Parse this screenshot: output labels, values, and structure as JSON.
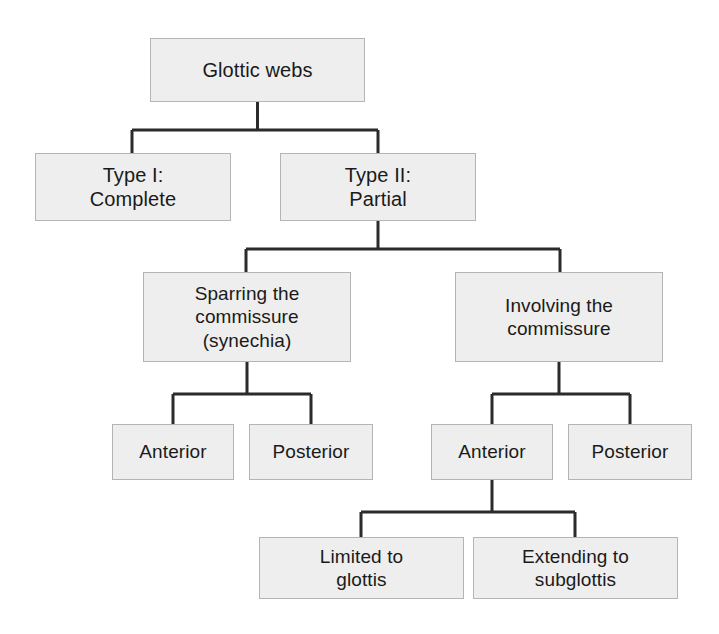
{
  "diagram": {
    "type": "tree",
    "style": {
      "node_fill": "#eeeeee",
      "node_border": "#b4b4b4",
      "connector_color": "#2b2b2b",
      "background": "#ffffff",
      "text_color": "#1a1a1a"
    },
    "nodes": {
      "root": "Glottic webs",
      "type1": "Type I:\nComplete",
      "type2": "Type II:\nPartial",
      "sparring": "Sparring the\ncommissure\n(synechia)",
      "involving": "Involving the\ncommissure",
      "anterior_left": "Anterior",
      "posterior_left": "Posterior",
      "anterior_right": "Anterior",
      "posterior_right": "Posterior",
      "limited": "Limited to\nglottis",
      "extending": "Extending to\nsubglottis"
    },
    "edges": [
      {
        "from": "root",
        "to": "type1"
      },
      {
        "from": "root",
        "to": "type2"
      },
      {
        "from": "type2",
        "to": "sparring"
      },
      {
        "from": "type2",
        "to": "involving"
      },
      {
        "from": "sparring",
        "to": "anterior_left"
      },
      {
        "from": "sparring",
        "to": "posterior_left"
      },
      {
        "from": "involving",
        "to": "anterior_right"
      },
      {
        "from": "involving",
        "to": "posterior_right"
      },
      {
        "from": "anterior_right",
        "to": "limited"
      },
      {
        "from": "anterior_right",
        "to": "extending"
      }
    ]
  }
}
